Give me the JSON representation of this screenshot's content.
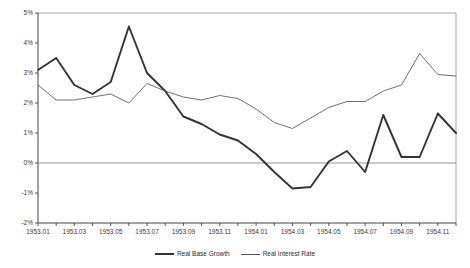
{
  "chart_data": {
    "type": "line",
    "title": "",
    "xlabel": "",
    "ylabel": "",
    "grid": false,
    "zero_line": true,
    "legend_position": "bottom-center",
    "ylim": [
      -0.02,
      0.05
    ],
    "ytick_labels": [
      "5%",
      "4%",
      "3%",
      "2%",
      "1%",
      "0%",
      "-1%",
      "-2%"
    ],
    "ytick_values": [
      5,
      4,
      3,
      2,
      1,
      0,
      -1,
      -2
    ],
    "x": [
      "1953.01",
      "1953.02",
      "1953.03",
      "1953.04",
      "1953.05",
      "1953.06",
      "1953.07",
      "1953.08",
      "1953.09",
      "1953.10",
      "1953.11",
      "1953.12",
      "1954.01",
      "1954.02",
      "1954.03",
      "1954.04",
      "1954.05",
      "1954.06",
      "1954.07",
      "1954.08",
      "1954.09",
      "1954.10",
      "1954.11",
      "1954.12"
    ],
    "xtick_labels": [
      "1953.01",
      "1953.03",
      "1953.05",
      "1953.07",
      "1953.09",
      "1953.11",
      "1954.01",
      "1954.03",
      "1954.05",
      "1954.07",
      "1954.09",
      "1954.11"
    ],
    "series": [
      {
        "name": "Real Base Growth",
        "color": "#333333",
        "width": 1.9,
        "values": [
          3.1,
          3.5,
          2.6,
          2.3,
          2.7,
          4.55,
          3.0,
          2.4,
          1.55,
          1.3,
          0.95,
          0.75,
          0.3,
          -0.3,
          -0.85,
          -0.8,
          0.05,
          0.4,
          -0.3,
          1.6,
          0.2,
          0.2,
          1.65,
          1.0
        ]
      },
      {
        "name": "Real Interest Rate",
        "color": "#555555",
        "width": 0.85,
        "values": [
          2.6,
          2.1,
          2.1,
          2.2,
          2.3,
          2.0,
          2.65,
          2.4,
          2.2,
          2.1,
          2.25,
          2.15,
          1.8,
          1.35,
          1.15,
          1.5,
          1.85,
          2.05,
          2.05,
          2.4,
          2.6,
          3.65,
          2.95,
          2.9
        ]
      }
    ]
  }
}
